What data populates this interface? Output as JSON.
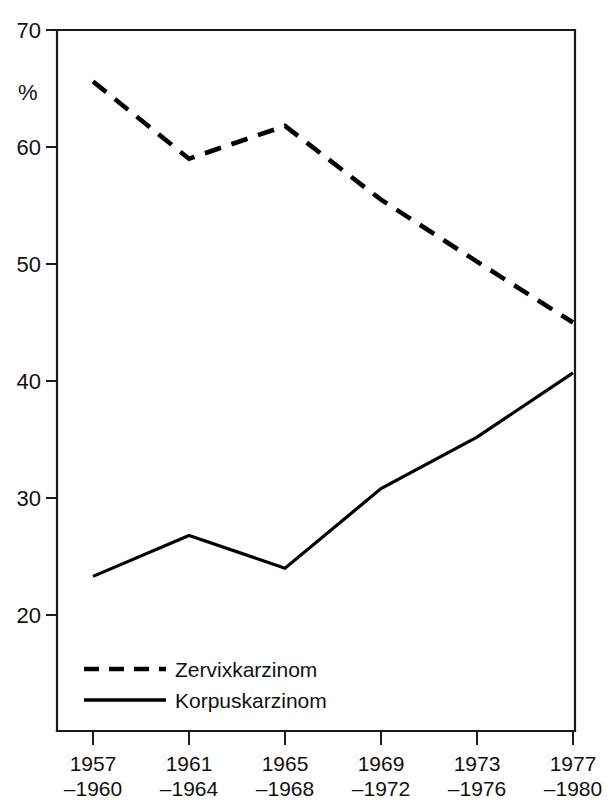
{
  "chart_data": {
    "type": "line",
    "title": "",
    "xlabel": "",
    "ylabel": "%",
    "ylim": [
      12,
      70
    ],
    "yticks": [
      20,
      30,
      40,
      50,
      60,
      70
    ],
    "ytick_labels": [
      "20",
      "30",
      "40",
      "50",
      "60",
      "70"
    ],
    "grid": false,
    "legend_position": "bottom-left inside plot",
    "categories": [
      "1957–1960",
      "1961–1964",
      "1965–1968",
      "1969–1972",
      "1973–1976",
      "1977–1980"
    ],
    "xtick_labels_line1": [
      "1957",
      "1961",
      "1965",
      "1969",
      "1973",
      "1977"
    ],
    "xtick_labels_line2": [
      "–1960",
      "–1964",
      "–1968",
      "–1972",
      "–1976",
      "–1980"
    ],
    "series": [
      {
        "name": "Zervixkarzinom",
        "style": "dashed",
        "color": "#000000",
        "values": [
          65.6,
          59.0,
          61.8,
          55.5,
          50.2,
          45.0
        ]
      },
      {
        "name": "Korpuskarzinom",
        "style": "solid",
        "color": "#000000",
        "values": [
          23.3,
          26.8,
          24.0,
          30.8,
          35.2,
          40.7
        ]
      }
    ]
  },
  "axis": {
    "y_unit_label": "%",
    "tick_0": "70",
    "tick_1": "60",
    "tick_2": "50",
    "tick_3": "40",
    "tick_4": "30",
    "tick_5": "20"
  },
  "xaxis": {
    "t0_top": "1957",
    "t0_bottom": "–1960",
    "t1_top": "1961",
    "t1_bottom": "–1964",
    "t2_top": "1965",
    "t2_bottom": "–1968",
    "t3_top": "1969",
    "t3_bottom": "–1972",
    "t4_top": "1973",
    "t4_bottom": "–1976",
    "t5_top": "1977",
    "t5_bottom": "–1980"
  },
  "legend": {
    "item_dashed_label": "Zervixkarzinom",
    "item_solid_label": "Korpuskarzinom"
  }
}
